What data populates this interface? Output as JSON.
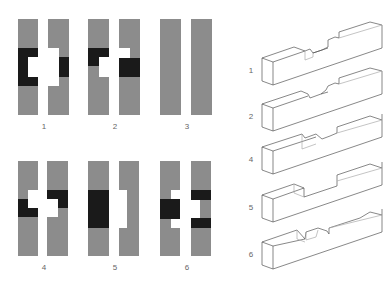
{
  "colors": {
    "background": "#ffffff",
    "member_gray": "#8c8c8c",
    "cut_black": "#1a1a1a",
    "line": "#555555",
    "label": "#666666"
  },
  "plan_views": [
    {
      "label": "1",
      "x": 18,
      "y": 19,
      "label_x": 44,
      "label_y": 122
    },
    {
      "label": "2",
      "x": 88,
      "y": 19,
      "label_x": 115,
      "label_y": 122
    },
    {
      "label": "3",
      "x": 160,
      "y": 19,
      "label_x": 187,
      "label_y": 122
    },
    {
      "label": "4",
      "x": 18,
      "y": 160,
      "label_x": 44,
      "label_y": 263
    },
    {
      "label": "5",
      "x": 88,
      "y": 160,
      "label_x": 115,
      "label_y": 263
    },
    {
      "label": "6",
      "x": 160,
      "y": 160,
      "label_x": 187,
      "label_y": 263
    }
  ],
  "iso_views": [
    {
      "label": "1",
      "label_x": 251,
      "label_y": 66
    },
    {
      "label": "2",
      "label_x": 251,
      "label_y": 112
    },
    {
      "label": "4",
      "label_x": 251,
      "label_y": 155
    },
    {
      "label": "5",
      "label_x": 251,
      "label_y": 203
    },
    {
      "label": "6",
      "label_x": 251,
      "label_y": 250
    }
  ]
}
